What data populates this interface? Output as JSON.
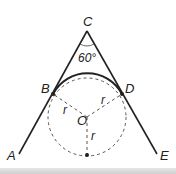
{
  "diagram": {
    "angle_label": "60°",
    "points": {
      "A": "A",
      "B": "B",
      "C": "C",
      "D": "D",
      "E": "E",
      "O": "O"
    },
    "radius_labels": [
      "r",
      "r",
      "r"
    ],
    "colors": {
      "stroke": "#222222",
      "dashed": "#555555"
    }
  }
}
